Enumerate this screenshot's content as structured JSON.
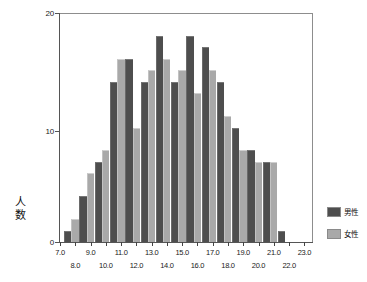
{
  "chart_data": {
    "type": "bar",
    "title": "",
    "subtitle": "",
    "xlabel": "",
    "ylabel": "人数",
    "xlim": [
      7.0,
      23.5
    ],
    "ylim": [
      0,
      20
    ],
    "yticks": [
      "0",
      "10",
      "20"
    ],
    "ytick_values": [
      0,
      10,
      20
    ],
    "xticks_row_upper": [
      "7.0",
      "9.0",
      "11.0",
      "13.0",
      "15.0",
      "17.0",
      "19.0",
      "21.0",
      "23.0"
    ],
    "xticks_row_lower": [
      "8.0",
      "10.0",
      "12.0",
      "14.0",
      "16.0",
      "18.0",
      "20.0",
      "22.0"
    ],
    "xtick_values_upper": [
      7.0,
      9.0,
      11.0,
      13.0,
      15.0,
      17.0,
      19.0,
      21.0,
      23.0
    ],
    "xtick_values_lower": [
      8.0,
      10.0,
      12.0,
      14.0,
      16.0,
      18.0,
      20.0,
      22.0
    ],
    "bin_centers": [
      7.75,
      8.75,
      9.75,
      10.75,
      11.75,
      12.75,
      13.75,
      14.75,
      15.75,
      16.75,
      17.75,
      18.75,
      19.75,
      20.75
    ],
    "grid": false,
    "legend_position": "right",
    "series": [
      {
        "name": "男性",
        "color": "#4e4e4e",
        "values": [
          1,
          4,
          7,
          14,
          16,
          14,
          18,
          14,
          18,
          17,
          14,
          10,
          8,
          7,
          1
        ]
      },
      {
        "name": "女性",
        "color": "#a9a9a9",
        "values": [
          2,
          6,
          8,
          16,
          10,
          15,
          16,
          15,
          13,
          15,
          11,
          8,
          7,
          7,
          0
        ]
      }
    ]
  },
  "legend": {
    "items": [
      {
        "label": "男性",
        "color": "#4e4e4e"
      },
      {
        "label": "女性",
        "color": "#a9a9a9"
      }
    ]
  },
  "axes": {
    "y_title": "人数"
  }
}
